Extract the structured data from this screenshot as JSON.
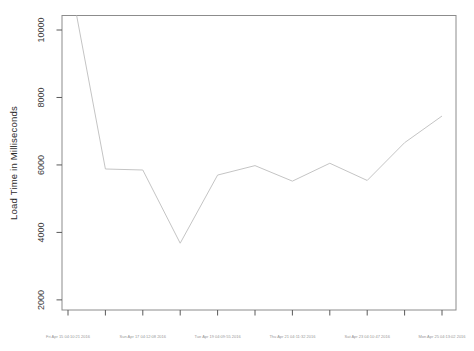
{
  "figure": {
    "ylabel": "Load Time in Milliseconds",
    "title": "",
    "xlabel": ""
  },
  "chart_data": {
    "type": "line",
    "title": "",
    "xlabel": "",
    "ylabel": "Load Time in Milliseconds",
    "n_points": 11,
    "values": [
      11800,
      5880,
      5850,
      3680,
      5700,
      5980,
      5520,
      6050,
      5540,
      6660,
      7450
    ],
    "x_tick_count": 11,
    "x_labels": [
      "Fri Apr 15 04:10:21 2016",
      "Sun Apr 17 04:12:08 2016",
      "Tue Apr 19 04:09:55 2016",
      "Thu Apr 21 04:11:32 2016",
      "Sat Apr 23 04:10:47 2016",
      "Mon Apr 25 04:13:02 2016"
    ],
    "x_label_point_indices": [
      0,
      2,
      4,
      6,
      8,
      10
    ],
    "y_ticks": [
      2000,
      4000,
      6000,
      8000,
      10000
    ],
    "ylim": [
      1700,
      10430
    ],
    "grid": false,
    "legend": null,
    "first_point_clipped_above": true,
    "colors": {
      "line": "#c4c4c4",
      "box": "#8c8c8c",
      "tick": "#5a5a5a",
      "y_tick_label": "#3a3a3a",
      "x_tick_label": "#979797",
      "background": "#ffffff"
    }
  }
}
